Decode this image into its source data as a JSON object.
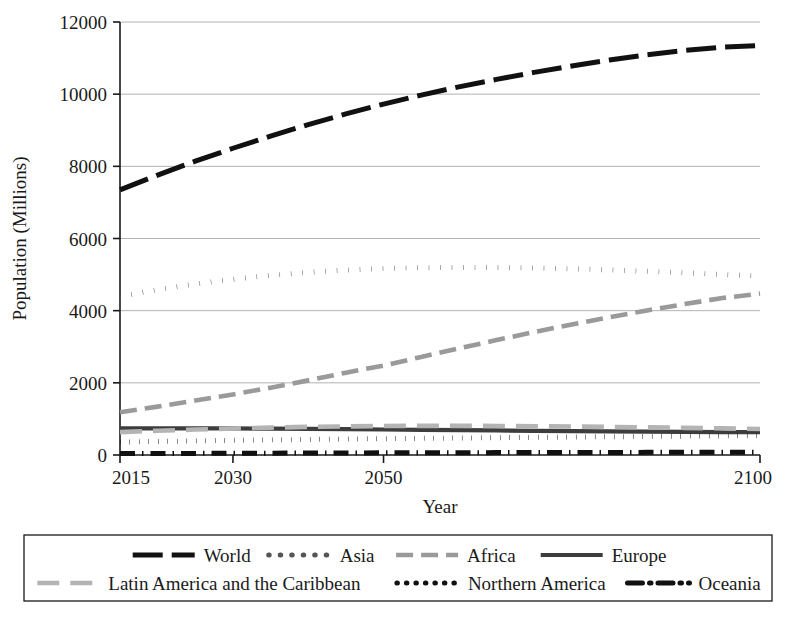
{
  "chart_data": {
    "type": "line",
    "title": "",
    "xlabel": "Year",
    "ylabel": "Population (Millions)",
    "xlim": [
      2015,
      2100
    ],
    "ylim": [
      0,
      12000
    ],
    "xticks": [
      2015,
      2030,
      2050,
      2100
    ],
    "xtick_labels": [
      "2015",
      "2030",
      "2050",
      "2100"
    ],
    "yticks": [
      0,
      2000,
      4000,
      6000,
      8000,
      10000,
      12000
    ],
    "ytick_labels": [
      "0",
      "2000",
      "4000",
      "6000",
      "8000",
      "10000",
      "12000"
    ],
    "grid": "horizontal",
    "legend_position": "below",
    "x": [
      2015,
      2020,
      2025,
      2030,
      2035,
      2040,
      2045,
      2050,
      2055,
      2060,
      2065,
      2070,
      2075,
      2080,
      2085,
      2090,
      2095,
      2100
    ],
    "series": [
      {
        "name": "World",
        "style": "long-dash",
        "color": "#111111",
        "width": 5.0,
        "dash": "30,9",
        "values": [
          7349,
          7758,
          8142,
          8501,
          8838,
          9157,
          9454,
          9725,
          9974,
          10202,
          10410,
          10603,
          10782,
          10946,
          11092,
          11213,
          11304,
          11350
        ]
      },
      {
        "name": "Asia",
        "style": "dotted",
        "color": "#555555",
        "width": 5.0,
        "dash": "0.5,11",
        "values": [
          4393,
          4581,
          4737,
          4869,
          4978,
          5063,
          5126,
          5167,
          5190,
          5199,
          5196,
          5184,
          5162,
          5130,
          5090,
          5045,
          5000,
          4956
        ]
      },
      {
        "name": "Africa",
        "style": "dashed",
        "color": "#9a9a9a",
        "width": 4.6,
        "dash": "17,8",
        "values": [
          1186,
          1340,
          1508,
          1679,
          1866,
          2068,
          2282,
          2478,
          2717,
          2953,
          3185,
          3407,
          3617,
          3817,
          4006,
          4184,
          4350,
          4473
        ]
      },
      {
        "name": "Europe",
        "style": "solid",
        "color": "#3d3d3d",
        "width": 4.2,
        "dash": "none",
        "values": [
          738,
          740,
          739,
          736,
          731,
          724,
          716,
          707,
          698,
          689,
          680,
          671,
          662,
          654,
          646,
          640,
          636,
          632
        ]
      },
      {
        "name": "Latin America and the Caribbean",
        "style": "long-dash",
        "color": "#b4b4b4",
        "width": 4.6,
        "dash": "22,11",
        "values": [
          634,
          672,
          706,
          735,
          759,
          779,
          793,
          803,
          808,
          808,
          805,
          798,
          789,
          778,
          766,
          752,
          738,
          721
        ]
      },
      {
        "name": "Northern America",
        "style": "dotted",
        "color": "#111111",
        "width": 5.0,
        "dash": "0.5,9",
        "values": [
          358,
          376,
          391,
          406,
          419,
          431,
          442,
          452,
          462,
          471,
          480,
          489,
          497,
          506,
          514,
          522,
          530,
          537
        ]
      },
      {
        "name": "Oceania",
        "style": "dash-dot",
        "color": "#111111",
        "width": 5.0,
        "dash": "15,7,1.5,7",
        "values": [
          39,
          42,
          45,
          48,
          51,
          54,
          57,
          60,
          62,
          64,
          66,
          68,
          70,
          71,
          73,
          74,
          75,
          76
        ]
      }
    ]
  },
  "legend": {
    "row1": [
      "World",
      "Asia",
      "Africa",
      "Europe"
    ],
    "row2": [
      "Latin America and the Caribbean",
      "Northern America",
      "Oceania"
    ]
  }
}
